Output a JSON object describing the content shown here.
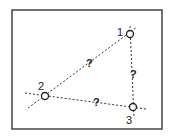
{
  "diagram": {
    "type": "triangle-network",
    "frame": {
      "x": 12,
      "y": 10,
      "w": 150,
      "h": 119,
      "color": "#444444"
    },
    "nodes": [
      {
        "id": "1",
        "label": "1",
        "x": 130,
        "y": 34,
        "label_x": 117,
        "label_y": 36
      },
      {
        "id": "2",
        "label": "2",
        "x": 45,
        "y": 96,
        "label_x": 38,
        "label_y": 90
      },
      {
        "id": "3",
        "label": "3",
        "x": 133,
        "y": 107,
        "label_x": 126,
        "label_y": 124
      }
    ],
    "edges": [
      {
        "from": "2",
        "to": "1",
        "label": "?",
        "label_x": 86,
        "label_y": 67,
        "ext": [
          [
            28,
            108
          ],
          [
            137,
            27
          ]
        ]
      },
      {
        "from": "1",
        "to": "3",
        "label": "?",
        "label_x": 130,
        "label_y": 78,
        "ext": [
          [
            130,
            26
          ],
          [
            134,
            117
          ]
        ]
      },
      {
        "from": "2",
        "to": "3",
        "label": "?",
        "label_x": 93,
        "label_y": 106,
        "ext": [
          [
            25,
            93
          ],
          [
            146,
            109
          ]
        ]
      }
    ],
    "line_color": "#333333",
    "line_style": "dotted"
  }
}
